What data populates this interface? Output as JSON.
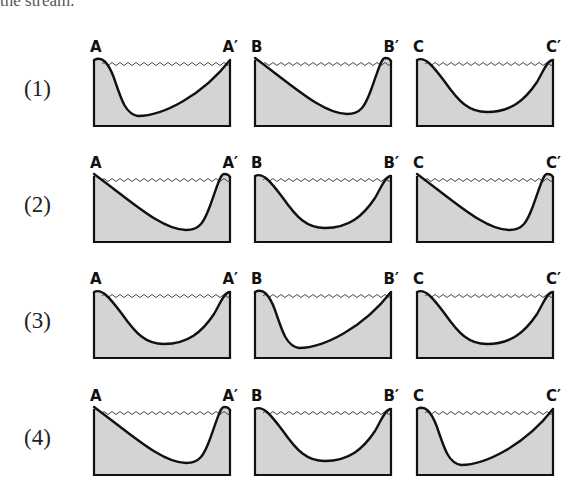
{
  "header": {
    "cut_text": "the stream."
  },
  "colors": {
    "ground_fill": "#d4d4d4",
    "outline": "#111111",
    "water_line": "#444444"
  },
  "rows": [
    {
      "number": "(1)",
      "panels": [
        {
          "left": "A",
          "right": "A′",
          "profile": "steep-left"
        },
        {
          "left": "B",
          "right": "B′",
          "profile": "steep-right"
        },
        {
          "left": "C",
          "right": "C′",
          "profile": "symmetric"
        }
      ]
    },
    {
      "number": "(2)",
      "panels": [
        {
          "left": "A",
          "right": "A′",
          "profile": "steep-right"
        },
        {
          "left": "B",
          "right": "B′",
          "profile": "symmetric"
        },
        {
          "left": "C",
          "right": "C′",
          "profile": "steep-right"
        }
      ]
    },
    {
      "number": "(3)",
      "panels": [
        {
          "left": "A",
          "right": "A′",
          "profile": "symmetric"
        },
        {
          "left": "B",
          "right": "B′",
          "profile": "steep-left"
        },
        {
          "left": "C",
          "right": "C′",
          "profile": "symmetric"
        }
      ]
    },
    {
      "number": "(4)",
      "panels": [
        {
          "left": "A",
          "right": "A′",
          "profile": "steep-right"
        },
        {
          "left": "B",
          "right": "B′",
          "profile": "symmetric"
        },
        {
          "left": "C",
          "right": "C′",
          "profile": "steep-left"
        }
      ]
    }
  ]
}
